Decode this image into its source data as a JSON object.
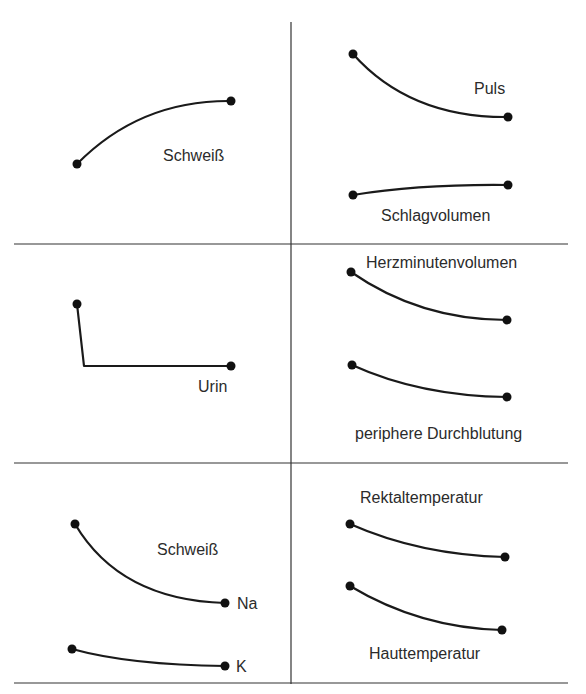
{
  "diagram": {
    "panels": [
      {
        "id": "top-left",
        "labels": [
          {
            "text": "Schweiß",
            "x": 163,
            "y": 161
          }
        ],
        "curves": [
          {
            "name": "sweat-curve",
            "d": "M77,164 Q140,100 231,101",
            "points": [
              [
                77,
                164
              ],
              [
                231,
                101
              ]
            ]
          }
        ]
      },
      {
        "id": "top-right",
        "labels": [
          {
            "text": "Puls",
            "x": 474,
            "y": 94
          },
          {
            "text": "Schlagvolumen",
            "x": 381,
            "y": 221
          }
        ],
        "curves": [
          {
            "name": "pulse-curve",
            "d": "M353,54 Q410,118 508,117",
            "points": [
              [
                353,
                54
              ],
              [
                508,
                117
              ]
            ]
          },
          {
            "name": "stroke-volume-curve",
            "d": "M353,195 Q420,184 508,185",
            "points": [
              [
                353,
                195
              ],
              [
                508,
                185
              ]
            ]
          }
        ]
      },
      {
        "id": "middle-left",
        "labels": [
          {
            "text": "Urin",
            "x": 198,
            "y": 392
          }
        ],
        "curves": [
          {
            "name": "urine-curve",
            "d": "M77,304 L84,366 L231,366",
            "points": [
              [
                77,
                304
              ],
              [
                231,
                366
              ]
            ]
          }
        ]
      },
      {
        "id": "middle-right",
        "labels": [
          {
            "text": "Herzminutenvolumen",
            "x": 366,
            "y": 268
          },
          {
            "text": "periphere Durchblutung",
            "x": 355,
            "y": 439
          }
        ],
        "curves": [
          {
            "name": "cardiac-output-curve",
            "d": "M351,272 Q420,320 507,320",
            "points": [
              [
                351,
                272
              ],
              [
                507,
                320
              ]
            ]
          },
          {
            "name": "peripheral-blood-flow-curve",
            "d": "M352,365 Q420,396 507,397",
            "points": [
              [
                352,
                365
              ],
              [
                507,
                397
              ]
            ]
          }
        ]
      },
      {
        "id": "bottom-left",
        "labels": [
          {
            "text": "Schweiß",
            "x": 157,
            "y": 555
          },
          {
            "text": "Na",
            "x": 237,
            "y": 609
          },
          {
            "text": "K",
            "x": 236,
            "y": 672
          }
        ],
        "curves": [
          {
            "name": "sweat-sodium-curve",
            "d": "M75,524 Q120,600 225,603",
            "points": [
              [
                75,
                524
              ],
              [
                225,
                603
              ]
            ]
          },
          {
            "name": "sweat-potassium-curve",
            "d": "M72,649 Q130,665 225,666",
            "points": [
              [
                72,
                649
              ],
              [
                225,
                666
              ]
            ]
          }
        ]
      },
      {
        "id": "bottom-right",
        "labels": [
          {
            "text": "Rektaltemperatur",
            "x": 360,
            "y": 503
          },
          {
            "text": "Hauttemperatur",
            "x": 369,
            "y": 659
          }
        ],
        "curves": [
          {
            "name": "rectal-temperature-curve",
            "d": "M350,524 Q420,555 505,557",
            "points": [
              [
                350,
                524
              ],
              [
                505,
                557
              ]
            ]
          },
          {
            "name": "skin-temperature-curve",
            "d": "M350,586 Q420,628 502,630",
            "points": [
              [
                350,
                586
              ],
              [
                502,
                630
              ]
            ]
          }
        ]
      }
    ],
    "grid": {
      "vertical": {
        "x": 291,
        "y1": 22,
        "y2": 684
      },
      "horizontal": [
        {
          "y": 244,
          "x1": 14,
          "x2": 568
        },
        {
          "y": 463,
          "x1": 14,
          "x2": 568
        },
        {
          "y": 683,
          "x1": 14,
          "x2": 568
        }
      ]
    }
  }
}
